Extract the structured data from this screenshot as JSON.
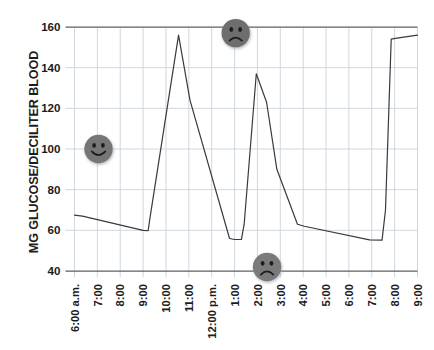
{
  "chart_data": {
    "type": "line",
    "title": "",
    "subtitle": "",
    "xlabel": "",
    "ylabel": "MG GLUCOSE/DECILITER BLOOD",
    "xlim": [
      0,
      15
    ],
    "ylim": [
      40,
      160
    ],
    "yticks": [
      40,
      60,
      80,
      100,
      120,
      140,
      160
    ],
    "ytick_labels": [
      "40",
      "60",
      "80",
      "100",
      "120",
      "140",
      "160"
    ],
    "xtick_labels": [
      "6:00 a.m.",
      "7:00",
      "8:00",
      "9:00",
      "10:00",
      "11:00",
      "12:00 p.m.",
      "1:00",
      "2:00",
      "3:00",
      "4:00",
      "5:00",
      "6:00",
      "7:00",
      "8:00",
      "9:00"
    ],
    "grid": true,
    "grid_color": "#c9d2dd",
    "axis_color": "#58606b",
    "line_color": "#3a3a3a",
    "legend": "none",
    "series": [
      {
        "name": "Blood glucose",
        "color": "#3a3a3a",
        "points": [
          {
            "x": 0.0,
            "y": 67.5
          },
          {
            "x": 0.35,
            "y": 67.0
          },
          {
            "x": 3.0,
            "y": 60.0
          },
          {
            "x": 3.22,
            "y": 59.8
          },
          {
            "x": 3.3,
            "y": 66.0
          },
          {
            "x": 4.55,
            "y": 156.0
          },
          {
            "x": 5.05,
            "y": 124.0
          },
          {
            "x": 6.78,
            "y": 56.0
          },
          {
            "x": 7.0,
            "y": 55.5
          },
          {
            "x": 7.3,
            "y": 55.5
          },
          {
            "x": 7.42,
            "y": 63.0
          },
          {
            "x": 7.95,
            "y": 137.0
          },
          {
            "x": 8.4,
            "y": 123.0
          },
          {
            "x": 8.85,
            "y": 90.0
          },
          {
            "x": 9.75,
            "y": 63.0
          },
          {
            "x": 10.05,
            "y": 62.0
          },
          {
            "x": 12.9,
            "y": 55.3
          },
          {
            "x": 13.45,
            "y": 55.2
          },
          {
            "x": 13.6,
            "y": 70.0
          },
          {
            "x": 13.85,
            "y": 154.0
          },
          {
            "x": 14.1,
            "y": 154.5
          },
          {
            "x": 15.0,
            "y": 156.0
          }
        ]
      }
    ],
    "annotations": [
      {
        "name": "happy-face-marker",
        "mood": "happy",
        "x_time": "7:00",
        "x": 1.05,
        "y": 100,
        "color": "#767676",
        "note": "normal glucose"
      },
      {
        "mood": "sad",
        "name": "sad-face-marker-high",
        "x_time": "1:00",
        "x": 7.05,
        "y": 157,
        "color": "#6e6e6e",
        "note": "high glucose"
      },
      {
        "mood": "sad",
        "name": "sad-face-marker-low",
        "x_time": "2:30",
        "x": 8.42,
        "y": 42,
        "color": "#7a7a7a",
        "note": "low glucose"
      }
    ]
  }
}
